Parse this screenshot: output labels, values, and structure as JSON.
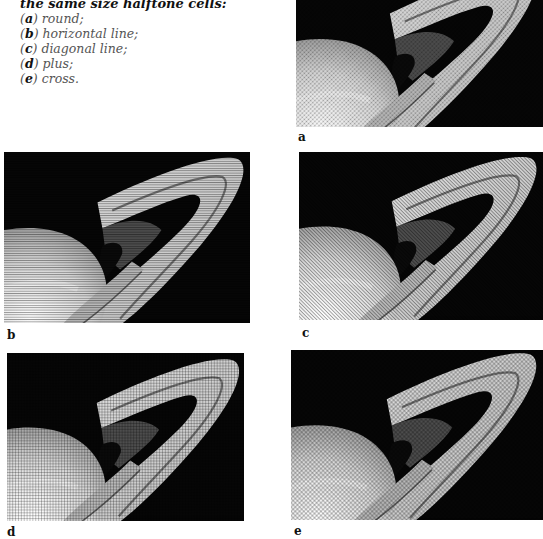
{
  "caption": {
    "heading": "the same size halftone cells:",
    "items": [
      {
        "letter": "a",
        "text": "round;"
      },
      {
        "letter": "b",
        "text": "horizontal line;"
      },
      {
        "letter": "c",
        "text": "diagonal line;"
      },
      {
        "letter": "d",
        "text": "plus;"
      },
      {
        "letter": "e",
        "text": "cross."
      }
    ]
  },
  "figures": [
    {
      "id": "a",
      "label": "a",
      "subject": "Saturn and rings",
      "halftone": "round"
    },
    {
      "id": "b",
      "label": "b",
      "subject": "Saturn and rings",
      "halftone": "horizontal line"
    },
    {
      "id": "c",
      "label": "c",
      "subject": "Saturn and rings",
      "halftone": "diagonal line"
    },
    {
      "id": "d",
      "label": "d",
      "subject": "Saturn and rings",
      "halftone": "plus"
    },
    {
      "id": "e",
      "label": "e",
      "subject": "Saturn and rings",
      "halftone": "cross"
    }
  ]
}
